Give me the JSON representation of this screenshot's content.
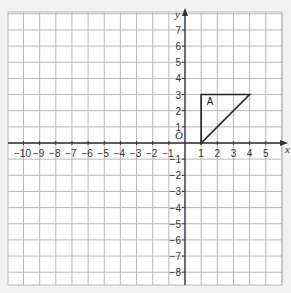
{
  "diagram": {
    "type": "coordinate-grid",
    "x_axis": {
      "label": "x",
      "min_tick": -10,
      "max_tick": 5,
      "ticks": [
        -10,
        -9,
        -8,
        -7,
        -6,
        -5,
        -4,
        -3,
        -2,
        -1,
        1,
        2,
        3,
        4,
        5
      ]
    },
    "y_axis": {
      "label": "y",
      "min_tick": -8,
      "max_tick": 7,
      "ticks": [
        7,
        6,
        5,
        4,
        3,
        2,
        1,
        -1,
        -2,
        -3,
        -4,
        -5,
        -6,
        -7,
        -8
      ]
    },
    "origin_label": "O",
    "shapes": [
      {
        "name": "A",
        "label": "A",
        "vertices": [
          [
            1,
            0
          ],
          [
            1,
            3
          ],
          [
            4,
            3
          ]
        ]
      }
    ],
    "colors": {
      "background": "#f2f2f2",
      "grid_bg": "#ffffff",
      "grid_line": "#b8b8b8",
      "axis": "#333333",
      "shape": "#222222"
    }
  }
}
